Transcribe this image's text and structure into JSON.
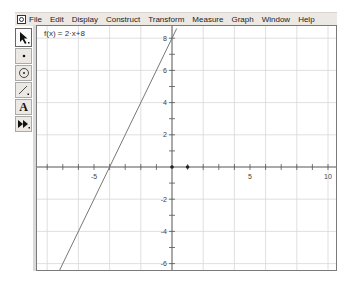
{
  "menubar": {
    "app_icon": "sketchpad-app-icon",
    "items": [
      "File",
      "Edit",
      "Display",
      "Construct",
      "Transform",
      "Measure",
      "Graph",
      "Window",
      "Help"
    ]
  },
  "toolbox": {
    "tools": [
      {
        "name": "arrow-tool",
        "glyph": "➘",
        "active": true
      },
      {
        "name": "point-tool",
        "glyph": "•"
      },
      {
        "name": "compass-tool",
        "glyph": "⊙"
      },
      {
        "name": "straightedge-tool",
        "glyph": "⟋"
      },
      {
        "name": "text-tool",
        "glyph": "A"
      },
      {
        "name": "custom-tool",
        "glyph": "⏩"
      }
    ]
  },
  "graph": {
    "function_label": "f(x) = 2·x+8",
    "colors": {
      "grid": "#d8d8d8",
      "axis": "#555555",
      "line": "#777777",
      "border": "#7a7a7a"
    }
  },
  "chart_data": {
    "type": "line",
    "title": "f(x) = 2·x+8",
    "series": [
      {
        "name": "f(x) = 2·x+8",
        "x": [
          -7.3,
          0,
          0.3
        ],
        "y": [
          -6.6,
          8,
          8.6
        ]
      }
    ],
    "xlim": [
      -8.6,
      10.6
    ],
    "ylim": [
      -6.6,
      8.6
    ],
    "x_tick_labels": [
      "-5",
      "5",
      "10"
    ],
    "y_tick_labels": [
      "8",
      "6",
      "4",
      "2",
      "-2",
      "-4",
      "-6"
    ],
    "grid": true,
    "grid_spacing": 2,
    "points": [
      {
        "x": 0,
        "y": 0
      },
      {
        "x": 1,
        "y": 0
      }
    ]
  }
}
